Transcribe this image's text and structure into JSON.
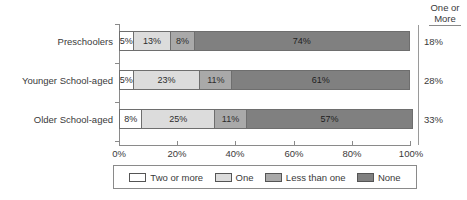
{
  "chart_data": {
    "type": "bar",
    "orientation": "horizontal",
    "stacked": true,
    "normalized_percent": true,
    "title": "",
    "xlabel": "",
    "ylabel": "",
    "xlim": [
      0,
      100
    ],
    "grid": false,
    "legend_position": "bottom",
    "categories": [
      "Preschoolers",
      "Younger School-aged",
      "Older School-aged"
    ],
    "x_tick_labels": [
      "0%",
      "20%",
      "40%",
      "60%",
      "80%",
      "100%"
    ],
    "x_tick_values": [
      0,
      20,
      40,
      60,
      80,
      100
    ],
    "series": [
      {
        "name": "Two or more",
        "color": "#ffffff",
        "values": [
          5,
          5,
          8
        ],
        "labels": [
          "5%",
          "5%",
          "8%"
        ]
      },
      {
        "name": "One",
        "color": "#dcdcdc",
        "values": [
          13,
          23,
          25
        ],
        "labels": [
          "13%",
          "23%",
          "25%"
        ]
      },
      {
        "name": "Less than one",
        "color": "#a9a9a9",
        "values": [
          8,
          11,
          11
        ],
        "labels": [
          "8%",
          "11%",
          "11%"
        ]
      },
      {
        "name": "None",
        "color": "#808080",
        "values": [
          74,
          61,
          57
        ],
        "labels": [
          "74%",
          "61%",
          "57%"
        ]
      }
    ],
    "annotation_column": {
      "header_line1": "One or",
      "header_line2": "More",
      "values": [
        "18%",
        "28%",
        "33%"
      ]
    }
  },
  "legend": {
    "items": [
      {
        "label": "Two or more",
        "color": "#ffffff"
      },
      {
        "label": "One",
        "color": "#dcdcdc"
      },
      {
        "label": "Less than one",
        "color": "#a9a9a9"
      },
      {
        "label": "None",
        "color": "#808080"
      }
    ]
  }
}
